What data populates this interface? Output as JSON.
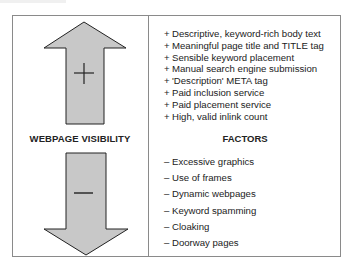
{
  "diagram": {
    "left_label": "WEBPAGE VISIBILITY",
    "right_label": "FACTORS",
    "up_arrow_symbol": "+",
    "down_arrow_symbol": "—",
    "arrow_fill": "#c8c8c8",
    "arrow_stroke": "#222222",
    "positive_prefix": "+",
    "negative_prefix": "–",
    "positive_factors": [
      "Descriptive, keyword-rich body text",
      "Meaningful page title and TITLE tag",
      "Sensible keyword placement",
      "Manual search engine submission",
      "'Description' META tag",
      "Paid inclusion service",
      "Paid placement service",
      "High, valid inlink count"
    ],
    "negative_factors": [
      "Excessive graphics",
      "Use of frames",
      "Dynamic webpages",
      "Keyword spamming",
      "Cloaking",
      "Doorway pages"
    ]
  }
}
